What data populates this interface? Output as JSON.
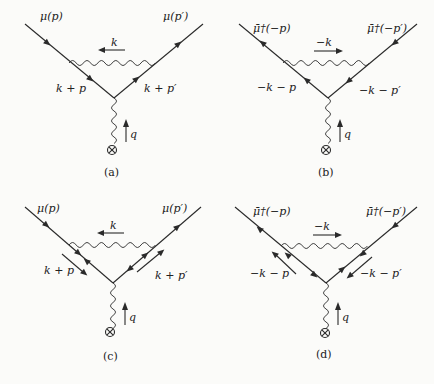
{
  "diagrams": [
    {
      "id": "a",
      "caption": "(a)",
      "incoming_label": "μ(p)",
      "outgoing_label": "μ(p′)",
      "photon_loop_label": "k",
      "left_internal_label": "k + p",
      "right_internal_label": "k + p′",
      "external_photon_label": "q"
    },
    {
      "id": "b",
      "caption": "(b)",
      "incoming_label": "μ̄†(−p)",
      "outgoing_label": "μ̄†(−p′)",
      "photon_loop_label": "−k",
      "left_internal_label": "−k − p",
      "right_internal_label": "−k − p′",
      "external_photon_label": "q"
    },
    {
      "id": "c",
      "caption": "(c)",
      "incoming_label": "μ(p)",
      "outgoing_label": "μ(p′)",
      "photon_loop_label": "k",
      "left_internal_label": "k + p",
      "right_internal_label": "k + p′",
      "external_photon_label": "q"
    },
    {
      "id": "d",
      "caption": "(d)",
      "incoming_label": "μ̄†(−p)",
      "outgoing_label": "μ̄†(−p′)",
      "photon_loop_label": "−k",
      "left_internal_label": "−k − p",
      "right_internal_label": "−k − p′",
      "external_photon_label": "q"
    }
  ],
  "colors": {
    "ink": "#2a2a2a",
    "background": "#fbfbf9"
  }
}
